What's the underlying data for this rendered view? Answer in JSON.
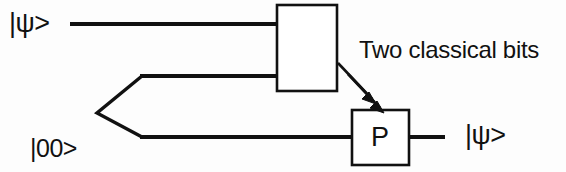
{
  "diagram": {
    "background_color": "#fdfdfd",
    "ink_color": "#111111",
    "labels": {
      "input_state": "|ψ>",
      "bell_pair_top": "|00>",
      "bell_pair_plus": "+",
      "bell_pair_bottom": "|11>",
      "classical_channel": "Two classical bits",
      "correction_gate": "P",
      "output_state": "|ψ>"
    },
    "elements": {
      "measurement_box": {
        "x": 277,
        "y": 5,
        "width": 60,
        "height": 86
      },
      "correction_box": {
        "x": 352,
        "y": 110,
        "width": 57,
        "height": 55
      },
      "top_wire": {
        "y": 24,
        "x1": 70,
        "x2": 277
      },
      "middle_wire": {
        "y": 76,
        "x1": 142,
        "x2": 277
      },
      "bottom_wire": {
        "y": 137,
        "x1": 142,
        "x2": 352
      },
      "output_wire": {
        "y": 137,
        "x1": 409,
        "x2": 445
      },
      "fork_apex": {
        "x": 97,
        "y": 113
      },
      "classical_arrow_count": 2
    }
  }
}
